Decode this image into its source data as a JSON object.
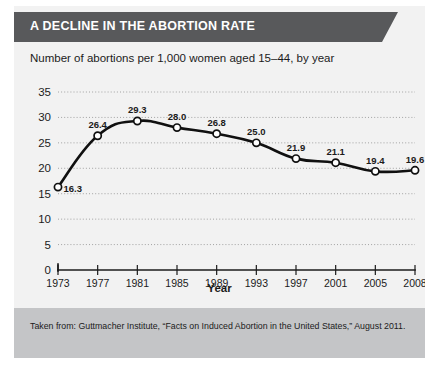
{
  "figure": {
    "title": "A DECLINE IN THE ABORTION RATE",
    "subtitle": "Number of abortions per 1,000 women aged 15–44, by year",
    "source_note": "Taken from: Guttmacher Institute, “Facts on Induced Abortion in the United States,” August 2011.",
    "colors": {
      "banner": "#58595b",
      "card_background": "#f2f2f2",
      "footer_background": "#c4c5c7",
      "line": "#101010",
      "marker_fill": "#ffffff",
      "gridline": "#9a9a9a",
      "text": "#1b1b1b",
      "banner_text": "#ffffff"
    }
  },
  "chart_data": {
    "type": "line",
    "title": "A DECLINE IN THE ABORTION RATE",
    "subtitle": "Number of abortions per 1,000 women aged 15–44, by year",
    "xlabel": "Year",
    "ylabel": "",
    "categories": [
      "1973",
      "1977",
      "1981",
      "1985",
      "1989",
      "1993",
      "1997",
      "2001",
      "2005",
      "2008"
    ],
    "values": [
      16.3,
      26.4,
      29.3,
      28.0,
      26.8,
      25.0,
      21.9,
      21.1,
      19.4,
      19.6
    ],
    "point_labels": [
      "16.3",
      "26.4",
      "29.3",
      "28.0",
      "26.8",
      "25.0",
      "21.9",
      "21.1",
      "19.4",
      "19.6"
    ],
    "ylim": [
      0,
      35
    ],
    "yticks": [
      0,
      5,
      10,
      15,
      20,
      25,
      30,
      35
    ],
    "ytick_labels": [
      "0",
      "5",
      "10",
      "15",
      "20",
      "25",
      "30",
      "35"
    ],
    "grid": true,
    "grid_axis": "y",
    "legend": false,
    "marker": "open-circle"
  }
}
